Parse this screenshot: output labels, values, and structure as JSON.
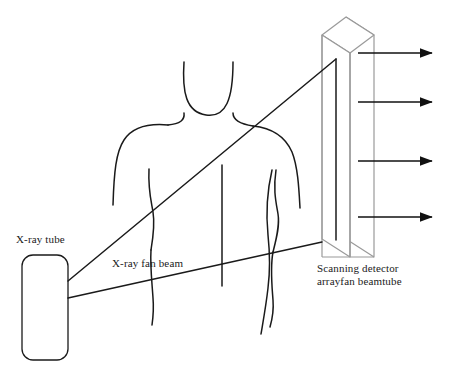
{
  "figure": {
    "type": "line-diagram",
    "background_color": "#ffffff",
    "stroke_color": "#1a1a1a",
    "light_stroke_color": "#9a9a9a"
  },
  "labels": {
    "xray_tube": "X-ray tube",
    "fan_beam": "X-ray fan beam",
    "detector_line1": "Scanning detector",
    "detector_line2": "arrayfan beamtube"
  },
  "components": {
    "xray_tube": {
      "name": "X-ray tube",
      "shape": "rounded-rectangle",
      "x": 22,
      "y": 255,
      "width": 46,
      "height": 105,
      "radius": 11
    },
    "patient": {
      "name": "Patient body outline",
      "parts": [
        "head-jaw",
        "neck-left",
        "neck-right",
        "shoulder-left",
        "shoulder-right",
        "arm-left",
        "arm-right",
        "torso-left-inner",
        "torso-right-inner"
      ]
    },
    "detector": {
      "name": "Scanning detector array",
      "shape": "3d-slab",
      "front_face": {
        "x": 322,
        "y": 35,
        "width": 28,
        "height": 222
      },
      "depth_x": 24,
      "depth_y": -18
    },
    "fan_beam": {
      "name": "X-ray fan beam",
      "apex": {
        "x": 68,
        "y": 281
      },
      "upper_ray_end": {
        "x": 336,
        "y": 59
      },
      "lower_ray_end": {
        "x": 322,
        "y": 242
      },
      "near_edge_top": {
        "x": 222,
        "y": 165
      },
      "near_edge_bottom": {
        "x": 222,
        "y": 286
      }
    },
    "output_arrows": {
      "name": "Detected signal arrows",
      "count": 4,
      "x_start": 358,
      "x_end": 438,
      "y_positions": [
        53,
        102,
        161,
        217
      ]
    }
  }
}
